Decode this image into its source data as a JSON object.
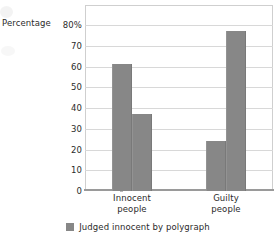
{
  "chart_data": {
    "type": "bar",
    "title": "",
    "subtitle": "",
    "xlabel": "",
    "ylabel": "Percentage",
    "ylim": [
      0,
      80
    ],
    "ytick_values": [
      80,
      70,
      60,
      50,
      40,
      30,
      20,
      10,
      0
    ],
    "ytick_labels": [
      "80%",
      "70",
      "60",
      "50",
      "40",
      "30",
      "20",
      "10",
      "0"
    ],
    "grid": true,
    "legend_position": "bottom",
    "categories": [
      "Innocent people",
      "Guilty people"
    ],
    "category_lines": [
      [
        "Innocent",
        "people"
      ],
      [
        "Guilty",
        "people"
      ]
    ],
    "series": [
      {
        "name": "Judged innocent by polygraph",
        "color": "#878787",
        "values": [
          61,
          24
        ]
      },
      {
        "name": "",
        "color": "#878787",
        "values": [
          37,
          77
        ]
      }
    ],
    "legend_entries": [
      {
        "label": "Judged innocent by polygraph",
        "color": "#878787"
      }
    ],
    "bar_color": "#878787",
    "gridline_color": "#d8d8d8",
    "axis_color": "#9a9a9a",
    "frame_color": "#cfcfcf",
    "text_color": "#2b2b2b",
    "background": "#ffffff"
  }
}
